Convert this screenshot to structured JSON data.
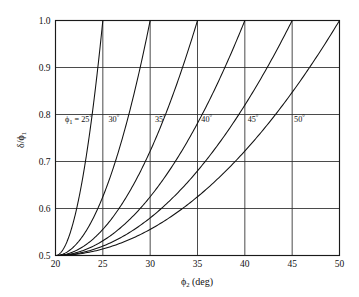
{
  "chart_data": {
    "type": "line",
    "title": "",
    "xlabel": "ϕ₂ (deg)",
    "ylabel": "δ/ϕ₁",
    "xlim": [
      20,
      50
    ],
    "ylim": [
      0.5,
      1.0
    ],
    "xticks": [
      20,
      25,
      30,
      35,
      40,
      45,
      50
    ],
    "yticks": [
      0.5,
      0.6,
      0.7,
      0.8,
      0.9,
      1.0
    ],
    "xtick_labels": [
      "20",
      "25",
      "30",
      "35",
      "40",
      "45",
      "50"
    ],
    "ytick_labels": [
      "0.5",
      "0.6",
      "0.7",
      "0.8",
      "0.9",
      "1.0"
    ],
    "grid": true,
    "legend_position": "inline-curve-labels",
    "line_color": "#111111",
    "grid_color": "#2b2b2b",
    "axis_color": "#1a1a1a",
    "background": "#ffffff",
    "series": [
      {
        "name": "ϕ₁ = 25°",
        "label": "ϕ₁ = 25°",
        "phi1": 25,
        "x": [
          20,
          20.5,
          21,
          21.5,
          22,
          22.5,
          23,
          23.5,
          24,
          24.5,
          25
        ],
        "values": [
          0.5,
          0.505,
          0.52,
          0.545,
          0.58,
          0.625,
          0.68,
          0.745,
          0.82,
          0.905,
          1.0
        ]
      },
      {
        "name": "30°",
        "label": "30°",
        "phi1": 30,
        "x": [
          20,
          21,
          22,
          23,
          24,
          25,
          26,
          27,
          28,
          29,
          30
        ],
        "values": [
          0.5,
          0.505,
          0.52,
          0.545,
          0.58,
          0.625,
          0.68,
          0.745,
          0.82,
          0.905,
          1.0
        ]
      },
      {
        "name": "35°",
        "label": "35°",
        "phi1": 35,
        "x": [
          20,
          21.5,
          23,
          24.5,
          26,
          27.5,
          29,
          30.5,
          32,
          33.5,
          35
        ],
        "values": [
          0.5,
          0.505,
          0.52,
          0.545,
          0.58,
          0.625,
          0.68,
          0.745,
          0.82,
          0.905,
          1.0
        ]
      },
      {
        "name": "40°",
        "label": "40°",
        "phi1": 40,
        "x": [
          20,
          22,
          24,
          26,
          28,
          30,
          32,
          34,
          36,
          38,
          40
        ],
        "values": [
          0.5,
          0.505,
          0.52,
          0.545,
          0.58,
          0.625,
          0.68,
          0.745,
          0.82,
          0.905,
          1.0
        ]
      },
      {
        "name": "45°",
        "label": "45°",
        "phi1": 45,
        "x": [
          20,
          22.5,
          25,
          27.5,
          30,
          32.5,
          35,
          37.5,
          40,
          42.5,
          45
        ],
        "values": [
          0.5,
          0.505,
          0.52,
          0.545,
          0.58,
          0.625,
          0.68,
          0.745,
          0.82,
          0.905,
          1.0
        ]
      },
      {
        "name": "50°",
        "label": "50°",
        "phi1": 50,
        "x": [
          20,
          23,
          26,
          29,
          32,
          35,
          38,
          41,
          44,
          47,
          50
        ],
        "values": [
          0.5,
          0.505,
          0.52,
          0.545,
          0.58,
          0.625,
          0.68,
          0.745,
          0.82,
          0.905,
          1.0
        ]
      }
    ],
    "curve_labels": [
      {
        "text": "ϕ₁ = 25°",
        "x": 21.0,
        "y": 0.785
      },
      {
        "text": "30°",
        "x": 25.6,
        "y": 0.785
      },
      {
        "text": "35°",
        "x": 30.5,
        "y": 0.785
      },
      {
        "text": "40°",
        "x": 35.4,
        "y": 0.785
      },
      {
        "text": "45°",
        "x": 40.3,
        "y": 0.785
      },
      {
        "text": "50°",
        "x": 45.2,
        "y": 0.785
      }
    ],
    "note": "Each curve rises from (20, 0.5) to (phi1, 1.0); delta/phi1 = 0.5*(1 + ((phi2-20)/(phi1-20))^2)"
  }
}
